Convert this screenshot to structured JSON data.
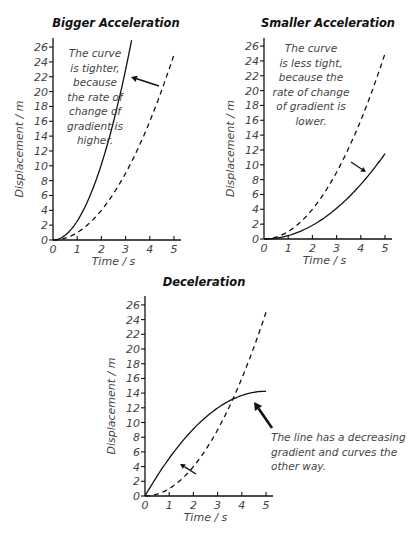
{
  "chart_data": [
    {
      "type": "line",
      "title": "Bigger Acceleration",
      "xlabel": "Time / s",
      "ylabel": "Displacement / m",
      "xlim": [
        0,
        5
      ],
      "ylim": [
        0,
        26
      ],
      "xticks": [
        0,
        1,
        2,
        3,
        4,
        5
      ],
      "yticks": [
        0,
        2,
        4,
        6,
        8,
        10,
        12,
        14,
        16,
        18,
        20,
        22,
        24,
        26
      ],
      "grid": false,
      "series": [
        {
          "name": "reference (dashed)",
          "style": "dashed",
          "x": [
            0,
            1,
            2,
            3,
            4,
            5
          ],
          "y": [
            0,
            1,
            4,
            9,
            16,
            25
          ]
        },
        {
          "name": "bigger acceleration (solid)",
          "style": "solid",
          "x": [
            0,
            1,
            2,
            3,
            3.25
          ],
          "y": [
            0,
            2.55,
            10.2,
            23,
            27
          ]
        }
      ],
      "annotation": {
        "lines": [
          "The curve",
          "is tighter,",
          "because",
          "the rate of",
          "change of",
          "gradient is",
          "higher."
        ],
        "arrow": "points from dashed curve to solid curve (leftward)"
      },
      "layout": {
        "origin_px": [
          53,
          240
        ],
        "x_px_per_unit": 24.2,
        "y_px_per_unit": 7.42,
        "x_axis_end_px": 181,
        "y_axis_top_px": 38,
        "ref_coef": 1.0,
        "curve": {
          "kind": "quad",
          "a": 2.55,
          "b": 0,
          "tmax": 3.25
        },
        "title_pos": [
          116,
          27
        ],
        "annot_center_x": 95,
        "annot_top_y": 57,
        "annot_line_h": 14.5,
        "arrow": {
          "from": [
            159,
            86
          ],
          "to": [
            131,
            77
          ],
          "head": 6,
          "width": 1.6
        },
        "small_arrow": null
      }
    },
    {
      "type": "line",
      "title": "Smaller Acceleration",
      "xlabel": "Time / s",
      "ylabel": "Displacement / m",
      "xlim": [
        0,
        5
      ],
      "ylim": [
        0,
        26
      ],
      "xticks": [
        0,
        1,
        2,
        3,
        4,
        5
      ],
      "yticks": [
        0,
        2,
        4,
        6,
        8,
        10,
        12,
        14,
        16,
        18,
        20,
        22,
        24,
        26
      ],
      "grid": false,
      "series": [
        {
          "name": "reference (dashed)",
          "style": "dashed",
          "x": [
            0,
            1,
            2,
            3,
            4,
            5
          ],
          "y": [
            0,
            1,
            4,
            9,
            16,
            25
          ]
        },
        {
          "name": "smaller acceleration (solid)",
          "style": "solid",
          "x": [
            0,
            1,
            2,
            3,
            4,
            5
          ],
          "y": [
            0,
            0.46,
            1.84,
            4.14,
            7.36,
            11.5
          ]
        }
      ],
      "annotation": {
        "lines": [
          "The curve",
          "is less tight,",
          "because the",
          "rate of change",
          "of gradient is",
          "lower."
        ],
        "arrow": "points from dashed curve to solid curve (down-right)"
      },
      "layout": {
        "origin_px": [
          264,
          239
        ],
        "x_px_per_unit": 24.2,
        "y_px_per_unit": 7.42,
        "x_axis_end_px": 392,
        "y_axis_top_px": 38,
        "ref_coef": 1.0,
        "curve": {
          "kind": "quad",
          "a": 0.46,
          "b": 0,
          "tmax": 5
        },
        "title_pos": [
          328,
          27
        ],
        "annot_center_x": 311,
        "annot_top_y": 52,
        "annot_line_h": 14.5,
        "arrow": {
          "from": [
            351,
            162
          ],
          "to": [
            366,
            172
          ],
          "head": 5,
          "width": 1.3
        },
        "small_arrow": null
      }
    },
    {
      "type": "line",
      "title": "Deceleration",
      "xlabel": "Time / s",
      "ylabel": "Displacement / m",
      "xlim": [
        0,
        5
      ],
      "ylim": [
        0,
        26
      ],
      "xticks": [
        0,
        1,
        2,
        3,
        4,
        5
      ],
      "yticks": [
        0,
        2,
        4,
        6,
        8,
        10,
        12,
        14,
        16,
        18,
        20,
        22,
        24,
        26
      ],
      "grid": false,
      "series": [
        {
          "name": "reference (dashed)",
          "style": "dashed",
          "x": [
            0,
            1,
            2,
            3,
            4,
            5
          ],
          "y": [
            0,
            1,
            4,
            9,
            16,
            25
          ]
        },
        {
          "name": "deceleration (solid)",
          "style": "solid",
          "x": [
            0,
            1,
            2,
            3,
            4,
            5
          ],
          "y": [
            0,
            5.1,
            9.1,
            11.9,
            13.7,
            14.3
          ]
        }
      ],
      "annotation": {
        "lines": [
          "The line has a decreasing",
          "gradient and curves the",
          "other way."
        ],
        "arrow": "points up-left toward the end of the solid curve"
      },
      "layout": {
        "origin_px": [
          145,
          496
        ],
        "x_px_per_unit": 24.2,
        "y_px_per_unit": 7.35,
        "x_axis_end_px": 273,
        "y_axis_top_px": 296,
        "ref_coef": 1.0,
        "curve": {
          "kind": "quad",
          "a": -0.57,
          "b": 5.7,
          "tmax": 5
        },
        "title_pos": [
          204,
          286
        ],
        "annot_left_x": 271,
        "annot_top_y": 441,
        "annot_line_h": 14.5,
        "arrow": {
          "from": [
            272,
            428
          ],
          "to": [
            254,
            402
          ],
          "head": 8,
          "width": 2.6
        },
        "small_arrow": {
          "from": [
            196,
            474
          ],
          "to": [
            180,
            464
          ],
          "head": 5,
          "width": 1.3
        }
      }
    }
  ]
}
